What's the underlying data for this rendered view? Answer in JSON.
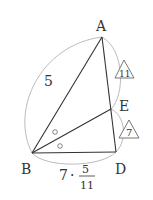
{
  "diagram": {
    "colors": {
      "stroke": "#333333",
      "arc": "#aaaaaa",
      "background": "#ffffff"
    },
    "vertices": {
      "A": {
        "label": "A",
        "x": 102,
        "y": 37
      },
      "B": {
        "label": "B",
        "x": 32,
        "y": 153
      },
      "D": {
        "label": "D",
        "x": 116,
        "y": 152
      },
      "E": {
        "label": "E",
        "x": 111,
        "y": 109
      }
    },
    "segments": [
      "AB",
      "AD",
      "BD",
      "BE"
    ],
    "side_labels": {
      "AB": "5",
      "BD_coef": "7",
      "BD_dot": "·",
      "BD_num": "5",
      "BD_den": "11"
    },
    "ratio_marks": {
      "AE": "11",
      "ED": "7"
    },
    "angle_marks": [
      "○",
      "○"
    ]
  }
}
